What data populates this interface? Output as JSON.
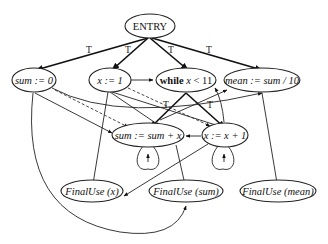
{
  "diagram": {
    "nodes": {
      "entry": "ENTRY",
      "sum_init": "sum := 0",
      "x_init": "x := 1",
      "while_pre": "while ",
      "while_var": "x",
      "while_post": " < 11",
      "mean": "mean := sum / 10",
      "sum_update": "sum := sum + x",
      "x_update": "x := x + 1",
      "final_x": "FinalUse (x)",
      "final_sum": "FinalUse (sum)",
      "final_mean": "FinalUse (mean)"
    },
    "edge_label_true": "T",
    "edges": [
      {
        "from": "entry",
        "to": "sum_init",
        "label": "T",
        "style": "bold"
      },
      {
        "from": "entry",
        "to": "x_init",
        "label": "T",
        "style": "bold"
      },
      {
        "from": "entry",
        "to": "while",
        "label": "T",
        "style": "bold"
      },
      {
        "from": "entry",
        "to": "mean",
        "label": "T",
        "style": "bold"
      },
      {
        "from": "while",
        "to": "sum_update",
        "label": "T",
        "style": "bold"
      },
      {
        "from": "while",
        "to": "x_update",
        "label": "T",
        "style": "bold"
      },
      {
        "from": "x_init",
        "to": "while",
        "style": "solid"
      },
      {
        "from": "x_init",
        "to": "sum_update",
        "style": "solid"
      },
      {
        "from": "x_init",
        "to": "x_update",
        "style": "solid"
      },
      {
        "from": "x_init",
        "to": "final_x",
        "style": "solid"
      },
      {
        "from": "x_init",
        "to": "x_update",
        "style": "dashed"
      },
      {
        "from": "sum_init",
        "to": "sum_update",
        "style": "solid"
      },
      {
        "from": "sum_init",
        "to": "sum_update",
        "style": "dashed"
      },
      {
        "from": "sum_init",
        "to": "mean",
        "style": "solid"
      },
      {
        "from": "sum_init",
        "to": "final_sum",
        "style": "solid"
      },
      {
        "from": "sum_update",
        "to": "sum_update",
        "style": "loop"
      },
      {
        "from": "x_update",
        "to": "x_update",
        "style": "loop"
      },
      {
        "from": "x_update",
        "to": "sum_update",
        "style": "solid"
      },
      {
        "from": "x_update",
        "to": "while",
        "style": "solid"
      },
      {
        "from": "x_update",
        "to": "final_x",
        "style": "solid"
      },
      {
        "from": "sum_update",
        "to": "mean",
        "style": "solid"
      },
      {
        "from": "sum_update",
        "to": "final_sum",
        "style": "solid"
      },
      {
        "from": "mean",
        "to": "final_mean",
        "style": "solid"
      }
    ]
  }
}
